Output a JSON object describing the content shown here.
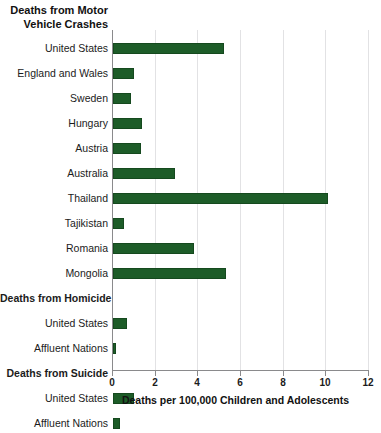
{
  "chart_data": {
    "type": "bar",
    "orientation": "horizontal",
    "title": "Deaths from Motor Vehicle Crashes",
    "title_lines": [
      "Deaths from Motor",
      "Vehicle Crashes"
    ],
    "xlabel": "Deaths per 100,000 Children and Adolescents",
    "ylabel": "",
    "xlim": [
      0,
      12
    ],
    "xticks": [
      0,
      2,
      4,
      6,
      8,
      10,
      12
    ],
    "xtick_labels": [
      "0",
      "2",
      "4",
      "6",
      "8",
      "10",
      "12"
    ],
    "grid": true,
    "legend": "none",
    "bar_color": "#1d5c28",
    "bar_edge_color": "#15491e",
    "gridline_color": "#e2e2e4",
    "axis_color": "#8a8a8c",
    "sections": [
      {
        "header": "Deaths from Motor Vehicle Crashes",
        "header_inline": false,
        "categories": [
          "United States",
          "England and Wales",
          "Sweden",
          "Hungary",
          "Austria",
          "Australia",
          "Thailand",
          "Tajikistan",
          "Romania",
          "Mongolia"
        ],
        "values": [
          5.2,
          1.0,
          0.85,
          1.35,
          1.3,
          2.9,
          10.1,
          0.5,
          3.8,
          5.3
        ]
      },
      {
        "header": "Deaths from Homicide",
        "header_inline": true,
        "categories": [
          "United States",
          "Affluent Nations"
        ],
        "values": [
          0.65,
          0.15
        ]
      },
      {
        "header": "Deaths from Suicide",
        "header_inline": true,
        "categories": [
          "United States",
          "Affluent Nations"
        ],
        "values": [
          1.0,
          0.35
        ]
      }
    ],
    "rows": [
      {
        "label": "United States",
        "value": 5.2,
        "type": "bar"
      },
      {
        "label": "England and Wales",
        "value": 1.0,
        "type": "bar"
      },
      {
        "label": "Sweden",
        "value": 0.85,
        "type": "bar"
      },
      {
        "label": "Hungary",
        "value": 1.35,
        "type": "bar"
      },
      {
        "label": "Austria",
        "value": 1.3,
        "type": "bar"
      },
      {
        "label": "Australia",
        "value": 2.9,
        "type": "bar"
      },
      {
        "label": "Thailand",
        "value": 10.1,
        "type": "bar"
      },
      {
        "label": "Tajikistan",
        "value": 0.5,
        "type": "bar"
      },
      {
        "label": "Romania",
        "value": 3.8,
        "type": "bar"
      },
      {
        "label": "Mongolia",
        "value": 5.3,
        "type": "bar"
      },
      {
        "label": "Deaths from Homicide",
        "value": null,
        "type": "section"
      },
      {
        "label": "United States",
        "value": 0.65,
        "type": "bar"
      },
      {
        "label": "Affluent Nations",
        "value": 0.15,
        "type": "bar"
      },
      {
        "label": "Deaths from Suicide",
        "value": null,
        "type": "section"
      },
      {
        "label": "United States",
        "value": 1.0,
        "type": "bar"
      },
      {
        "label": "Affluent Nations",
        "value": 0.35,
        "type": "bar"
      }
    ]
  }
}
